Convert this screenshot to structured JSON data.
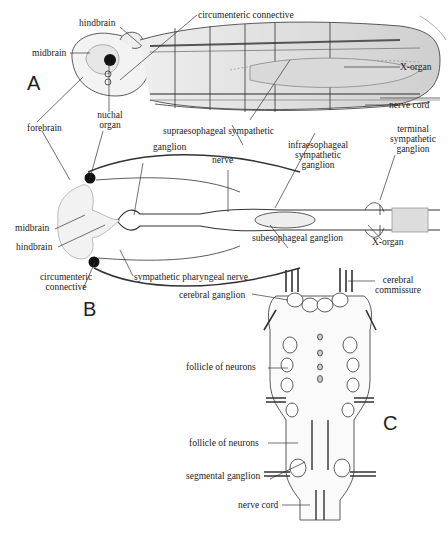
{
  "figure": {
    "panels": {
      "a": "A",
      "b": "B",
      "c": "C"
    },
    "panel_a": {
      "hindbrain": "hindbrain",
      "circumenteric_connective": "circumenteric connective",
      "midbrain": "midbrain",
      "x_organ": "X-organ",
      "nerve_cord": "nerve cord",
      "forebrain": "forebrain",
      "nuchal_organ_1": "nuchal",
      "nuchal_organ_2": "organ"
    },
    "panel_b": {
      "supraesophageal_sympathetic": "supraesophageal  sympathetic",
      "ganglion": "ganglion",
      "nerve": "nerve",
      "infraesophageal_1": "infraesophageal",
      "infraesophageal_2": "sympathetic",
      "infraesophageal_3": "ganglion",
      "terminal_1": "terminal",
      "terminal_2": "sympathetic",
      "terminal_3": "ganglion",
      "midbrain": "midbrain",
      "hindbrain": "hindbrain",
      "subesophageal_ganglion": "subesophageal  ganglion",
      "x_organ": "X-organ",
      "circumenteric_1": "circumenteric",
      "circumenteric_2": "connective",
      "sympathetic_pharyngeal_nerve": "sympathetic  pharyngeal  nerve"
    },
    "panel_c": {
      "cerebral_ganglion": "cerebral  ganglion",
      "cerebral_commissure_1": "cerebral",
      "cerebral_commissure_2": "commissure",
      "follicle_upper": "follicle  of  neurons",
      "follicle_lower": "follicle  of  neurons",
      "segmental_ganglion": "segmental  ganglion",
      "nerve_cord": "nerve  cord"
    }
  }
}
